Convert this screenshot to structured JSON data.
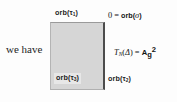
{
  "figure": {
    "prose_text": "we have",
    "square": {
      "fill_color": "#d6d6d6",
      "border_right_color": "#4c4c4c",
      "border_color": "#b0b0b0"
    },
    "labels": {
      "top": {
        "base": "orb(",
        "sub": "1",
        "tau": "τ",
        "close": ")",
        "full": "orb(τ₁)"
      },
      "bottom_right": {
        "base": "orb(",
        "sub": "2",
        "tau": "τ",
        "close": ")",
        "full": "orb(τ₂)"
      },
      "inner_bottom_left": {
        "base": "orb(",
        "sub": "3",
        "tau": "τ",
        "close": ")",
        "full": "orb(τ₃)",
        "highlight_color": "#e7e7e7"
      }
    },
    "equations": {
      "top_right": {
        "zero": "0",
        "equals": "=",
        "orb": "orb(",
        "sigma": "σ",
        "close": ")",
        "full": "0 = orb(σ)"
      },
      "right_middle": {
        "operator": "T",
        "operator_sub": "N",
        "open": "(",
        "delta": "Δ",
        "close": ")",
        "equals": "=",
        "value": "A",
        "value_sub": "g",
        "value_sup": "2",
        "full": "T_N(Δ) = A_g²"
      }
    }
  }
}
